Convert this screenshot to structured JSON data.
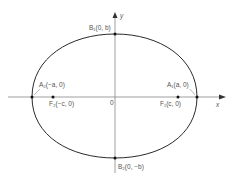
{
  "diagram": {
    "type": "ellipse-with-axes",
    "colors": {
      "curve": "#2a2a2a",
      "axis": "#666666",
      "point": "#111111",
      "label": "#555555"
    },
    "axes": {
      "x_label": "x",
      "y_label": "y",
      "origin_label": "0"
    },
    "points": {
      "B1": "B₁(0, b)",
      "B2": "B₂(0, −b)",
      "A1": "A₁(a, 0)",
      "A2": "A₂(−a, 0)",
      "F1": "F₁(c, 0)",
      "F2": "F₂(−c, 0)"
    }
  }
}
